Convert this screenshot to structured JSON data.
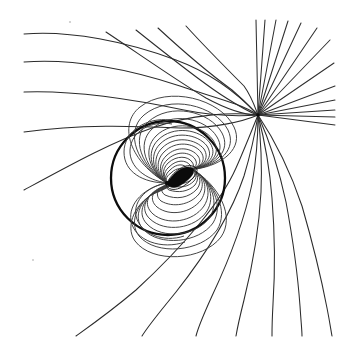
{
  "figure": {
    "background_color": "#ffffff",
    "line_color": "#2b2b2b",
    "separatrix_color": "#0d0d0d",
    "core_color": "#0b0b0b",
    "width": 343,
    "height": 345
  },
  "chart_data": {
    "type": "line",
    "title": "",
    "xlabel": "",
    "ylabel": "",
    "grid": false,
    "legend": null,
    "xlim": [
      0,
      343
    ],
    "ylim": [
      0,
      345
    ],
    "singularities": [
      {
        "name": "dipole-center",
        "kind": "dipole",
        "x": 167,
        "y": 183,
        "tilt_degrees": -30
      },
      {
        "name": "saddle-point",
        "kind": "x-point",
        "x": 258,
        "y": 115
      }
    ],
    "separatrix": {
      "name": "separatrix-circle",
      "shape": "circle",
      "cx": 168,
      "cy": 178,
      "r": 57,
      "stroke_width": 2.3
    },
    "core_lens": {
      "name": "dipole-core-lens",
      "shape": "lens",
      "start": [
        167,
        184
      ],
      "end": [
        192,
        168
      ],
      "bulge": 7
    },
    "series": [
      {
        "name": "inner-loops-upper",
        "kind": "closed-loop-family",
        "count": 11,
        "note": "nested loops above the dipole axis, pinched at the dipole center"
      },
      {
        "name": "inner-loops-lower",
        "kind": "closed-loop-family",
        "count": 11,
        "note": "nested loops below the dipole axis, pinched at the dipole center"
      },
      {
        "name": "incoming-streamlines",
        "kind": "open-streamline-family",
        "count": 9,
        "entry_edges": [
          "left",
          "top"
        ],
        "note": "sweep rightward and converge on the saddle point"
      },
      {
        "name": "outgoing-fan",
        "kind": "radial-fan",
        "count": 13,
        "exit_edges": [
          "top",
          "right"
        ],
        "note": "straight rays emanating from the saddle point"
      },
      {
        "name": "lower-exit-streamlines",
        "kind": "open-streamline-family",
        "count": 7,
        "exit_edges": [
          "bottom"
        ],
        "note": "curve down and out past the separatrix circle"
      }
    ]
  }
}
